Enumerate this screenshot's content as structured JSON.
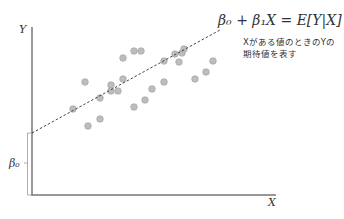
{
  "diagram": {
    "axes": {
      "y_label": "Y",
      "x_label": "X",
      "intercept_label": "β₀",
      "axis_color": "#777777"
    },
    "regression_line": {
      "equation": "β₀ + β₁X = E[Y|X]",
      "style": "dashed",
      "color": "#444444"
    },
    "annotation": {
      "line1": "XがあるY値のときのYの",
      "line1_display": "Xがある値のときのYの",
      "line2": "期待値を表す"
    },
    "points_color": "#bdbdbd",
    "points_stroke": "#9e9e9e"
  },
  "chart_data": {
    "type": "scatter",
    "title": "",
    "xlabel": "X",
    "ylabel": "Y",
    "annotations": [
      "β₀ + β₁X = E[Y|X]",
      "Xがある値のときのYの期待値を表す",
      "β₀"
    ],
    "points_px": [
      [
        73,
        109
      ],
      [
        88,
        126
      ],
      [
        100,
        119
      ],
      [
        100,
        98
      ],
      [
        85,
        82
      ],
      [
        111,
        85
      ],
      [
        111,
        91
      ],
      [
        118,
        91
      ],
      [
        123,
        79
      ],
      [
        123,
        58
      ],
      [
        134,
        51
      ],
      [
        141,
        51
      ],
      [
        134,
        107
      ],
      [
        145,
        100
      ],
      [
        152,
        89
      ],
      [
        164,
        82
      ],
      [
        164,
        61
      ],
      [
        175,
        54
      ],
      [
        182,
        53
      ],
      [
        184,
        49
      ],
      [
        179,
        62
      ],
      [
        213,
        61
      ],
      [
        206,
        72
      ],
      [
        195,
        79
      ]
    ],
    "fit_line_px": [
      [
        32,
        133
      ],
      [
        220,
        30
      ]
    ],
    "grid": false
  }
}
